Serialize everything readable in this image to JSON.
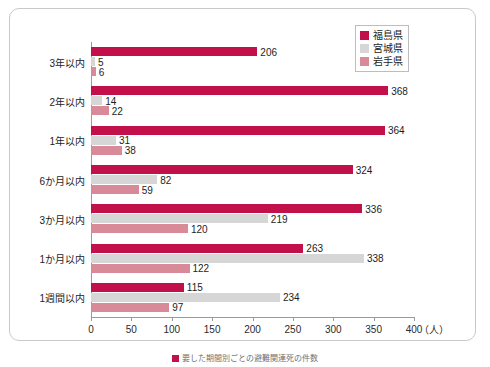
{
  "chart_data": {
    "type": "bar",
    "orientation": "horizontal",
    "title": "",
    "xlabel": "（人）",
    "ylabel": "",
    "xlim": [
      0,
      400
    ],
    "xticks": [
      0,
      50,
      100,
      150,
      200,
      250,
      300,
      350,
      400
    ],
    "grid": false,
    "legend_position": "top-right",
    "categories": [
      "3年以内",
      "2年以内",
      "1年以内",
      "6か月以内",
      "3か月以内",
      "1か月以内",
      "1週間以内"
    ],
    "series": [
      {
        "name": "福島県",
        "color": "#c2104a",
        "values": [
          206,
          368,
          364,
          324,
          336,
          263,
          115
        ]
      },
      {
        "name": "宮城県",
        "color": "#d6d6d6",
        "values": [
          5,
          14,
          31,
          82,
          219,
          338,
          234
        ]
      },
      {
        "name": "岩手県",
        "color": "#d98a99",
        "values": [
          6,
          22,
          38,
          59,
          120,
          122,
          97
        ]
      }
    ]
  },
  "legend": {
    "items": [
      {
        "label": "福島県",
        "color": "#c2104a"
      },
      {
        "label": "宮城県",
        "color": "#d6d6d6"
      },
      {
        "label": "岩手県",
        "color": "#d98a99"
      }
    ]
  },
  "axis": {
    "unit": "（人）",
    "ticks": [
      "0",
      "50",
      "100",
      "150",
      "200",
      "250",
      "300",
      "350",
      "400"
    ]
  },
  "caption": {
    "text": "要した期間別ごとの避難関連死の件数",
    "swatch_color": "#c2104a"
  }
}
